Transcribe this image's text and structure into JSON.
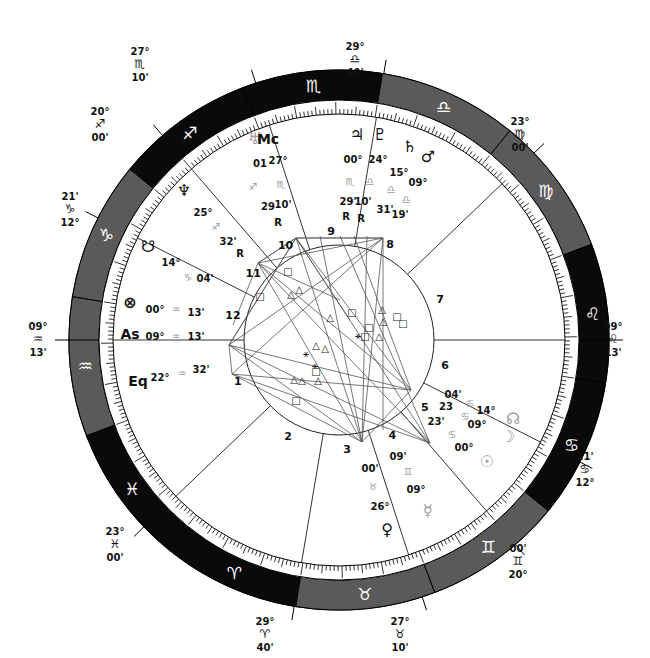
{
  "center": {
    "x": 339,
    "y": 340
  },
  "radii": {
    "outer": 270,
    "sign_inner": 240,
    "tick_inner": 226,
    "inner_circle": 95
  },
  "colors": {
    "dark": "#0a0a0a",
    "gray": "#5a5a5a",
    "line": "#333333",
    "text": "#111111",
    "faint": "#9a9a9a"
  },
  "ascendant_longitude": 309.217,
  "signs": [
    {
      "name": "Aries",
      "glyph": "♈",
      "start": 0,
      "shade": "dark"
    },
    {
      "name": "Taurus",
      "glyph": "♉",
      "start": 30,
      "shade": "gray"
    },
    {
      "name": "Gemini",
      "glyph": "♊",
      "start": 60,
      "shade": "gray"
    },
    {
      "name": "Cancer",
      "glyph": "♋",
      "start": 90,
      "shade": "dark"
    },
    {
      "name": "Leo",
      "glyph": "♌",
      "start": 120,
      "shade": "dark"
    },
    {
      "name": "Virgo",
      "glyph": "♍",
      "start": 150,
      "shade": "gray"
    },
    {
      "name": "Libra",
      "glyph": "♎",
      "start": 180,
      "shade": "gray"
    },
    {
      "name": "Scorpio",
      "glyph": "♏",
      "start": 210,
      "shade": "dark"
    },
    {
      "name": "Sagittarius",
      "glyph": "♐",
      "start": 240,
      "shade": "dark"
    },
    {
      "name": "Capricorn",
      "glyph": "♑",
      "start": 270,
      "shade": "gray"
    },
    {
      "name": "Aquarius",
      "glyph": "♒",
      "start": 300,
      "shade": "gray"
    },
    {
      "name": "Pisces",
      "glyph": "♓",
      "start": 330,
      "shade": "dark"
    }
  ],
  "houses": [
    {
      "num": "1",
      "lon": 309.217,
      "deg": "09°",
      "sign": "♒",
      "min": "13'"
    },
    {
      "num": "2",
      "lon": 353.0,
      "deg": "23°",
      "sign": "♓",
      "min": "00'"
    },
    {
      "num": "3",
      "lon": 29.667,
      "deg": "29°",
      "sign": "♈",
      "min": "40'"
    },
    {
      "num": "4",
      "lon": 57.167,
      "deg": "27°",
      "sign": "♉",
      "min": "10'"
    },
    {
      "num": "5",
      "lon": 80.0,
      "deg": "20°",
      "sign": "♊",
      "min": "00'"
    },
    {
      "num": "6",
      "lon": 102.35,
      "deg": "12°",
      "sign": "♋",
      "min": "21'"
    },
    {
      "num": "7",
      "lon": 129.217,
      "deg": "09°",
      "sign": "♌",
      "min": "13'"
    },
    {
      "num": "8",
      "lon": 173.0,
      "deg": "23°",
      "sign": "♍",
      "min": "00'"
    },
    {
      "num": "9",
      "lon": 209.667,
      "deg": "29°",
      "sign": "♎",
      "min": "40'"
    },
    {
      "num": "10",
      "lon": 237.167,
      "deg": "27°",
      "sign": "♏",
      "min": "10'"
    },
    {
      "num": "11",
      "lon": 260.0,
      "deg": "20°",
      "sign": "♐",
      "min": "00'"
    },
    {
      "num": "12",
      "lon": 282.35,
      "deg": "12°",
      "sign": "♑",
      "min": "21'"
    }
  ],
  "cusp_labels": [
    {
      "id": "cusp-10",
      "text": [
        "27°",
        "♏",
        "10'"
      ],
      "x": 140,
      "y": 55
    },
    {
      "id": "cusp-9",
      "text": [
        "29°",
        "♎",
        "40'"
      ],
      "x": 355,
      "y": 50
    },
    {
      "id": "cusp-11",
      "text": [
        "20°",
        "♐",
        "00'"
      ],
      "x": 100,
      "y": 115
    },
    {
      "id": "cusp-8",
      "text": [
        "23°",
        "♍",
        "00'"
      ],
      "x": 520,
      "y": 125
    },
    {
      "id": "cusp-12",
      "text": [
        "21'",
        "♑",
        "12°"
      ],
      "x": 70,
      "y": 200
    },
    {
      "id": "cusp-1",
      "text": [
        "09°",
        "♒",
        "13'"
      ],
      "x": 38,
      "y": 330
    },
    {
      "id": "cusp-7",
      "text": [
        "09°",
        "♌",
        "13'"
      ],
      "x": 613,
      "y": 330
    },
    {
      "id": "cusp-6",
      "text": [
        "21'",
        "♋",
        "12°"
      ],
      "x": 585,
      "y": 460
    },
    {
      "id": "cusp-2",
      "text": [
        "23°",
        "♓",
        "00'"
      ],
      "x": 115,
      "y": 535
    },
    {
      "id": "cusp-5",
      "text": [
        "00'",
        "♊",
        "20°"
      ],
      "x": 518,
      "y": 552
    },
    {
      "id": "cusp-3",
      "text": [
        "29°",
        "♈",
        "40'"
      ],
      "x": 265,
      "y": 625
    },
    {
      "id": "cusp-4",
      "text": [
        "27°",
        "♉",
        "10'"
      ],
      "x": 400,
      "y": 625
    }
  ],
  "planets": [
    {
      "name": "Uranus",
      "glyph": "♅",
      "x": 255,
      "y": 144,
      "faint": true,
      "deg": "01",
      "deg_pos": [
        260,
        167
      ],
      "sign": "♐",
      "sign_pos": [
        253,
        190
      ],
      "min": "29",
      "min_pos": [
        268,
        210
      ],
      "retro": "R",
      "retro_pos": [
        278,
        226
      ]
    },
    {
      "name": "Midheaven",
      "glyph": "Mc",
      "x": 268,
      "y": 144,
      "bold": true,
      "deg": "27°",
      "deg_pos": [
        278,
        164
      ],
      "sign": "♏",
      "sign_pos": [
        281,
        188
      ],
      "min": "10'",
      "min_pos": [
        283,
        208
      ]
    },
    {
      "name": "Neptune",
      "glyph": "♆",
      "x": 184,
      "y": 196,
      "deg": "25°",
      "deg_pos": [
        203,
        216
      ],
      "sign": "♐",
      "sign_pos": [
        216,
        230
      ],
      "min": "32'",
      "min_pos": [
        228,
        245
      ],
      "retro": "R",
      "retro_pos": [
        240,
        257
      ]
    },
    {
      "name": "Jupiter",
      "glyph": "♃",
      "x": 357,
      "y": 140,
      "deg": "00°",
      "deg_pos": [
        353,
        163
      ],
      "sign": "♏",
      "sign_pos": [
        350,
        185
      ],
      "min": "29'",
      "min_pos": [
        348,
        205
      ],
      "retro": "R",
      "retro_pos": [
        346,
        220
      ]
    },
    {
      "name": "Pluto",
      "glyph": "♇",
      "x": 380,
      "y": 140,
      "deg": "24°",
      "deg_pos": [
        378,
        163
      ],
      "sign": "♎",
      "sign_pos": [
        370,
        185
      ],
      "min": "10'",
      "min_pos": [
        363,
        205
      ],
      "retro": "R",
      "retro_pos": [
        361,
        222
      ]
    },
    {
      "name": "Saturn",
      "glyph": "♄",
      "x": 410,
      "y": 152,
      "deg": "15°",
      "deg_pos": [
        399,
        176
      ],
      "sign": "♎",
      "sign_pos": [
        391,
        193
      ],
      "min": "31'",
      "min_pos": [
        385,
        213
      ]
    },
    {
      "name": "Mars",
      "glyph": "♂",
      "x": 428,
      "y": 162,
      "deg": "09°",
      "deg_pos": [
        418,
        186
      ],
      "sign": "♎",
      "sign_pos": [
        406,
        203
      ],
      "min": "19'",
      "min_pos": [
        400,
        218
      ]
    },
    {
      "name": "South Node",
      "glyph": "☋",
      "x": 148,
      "y": 252,
      "deg": "14°",
      "deg_pos": [
        171,
        266
      ],
      "sign": "♑",
      "sign_pos": [
        188,
        281
      ],
      "min": "04'",
      "min_pos": [
        205,
        282
      ]
    },
    {
      "name": "Part of Fortune",
      "glyph": "⊗",
      "x": 130,
      "y": 308,
      "deg": "00°",
      "deg_pos": [
        155,
        313
      ],
      "sign": "♒",
      "sign_pos": [
        176,
        313
      ],
      "min": "13'",
      "min_pos": [
        196,
        316
      ]
    },
    {
      "name": "Ascendant",
      "glyph": "As",
      "x": 130,
      "y": 339,
      "bold": true,
      "deg": "09°",
      "deg_pos": [
        155,
        340
      ],
      "sign": "♒",
      "sign_pos": [
        176,
        340
      ],
      "min": "13'",
      "min_pos": [
        196,
        340
      ]
    },
    {
      "name": "Equatorial Ascendant",
      "glyph": "Eq",
      "x": 138,
      "y": 386,
      "bold": true,
      "deg": "22°",
      "deg_pos": [
        160,
        381
      ],
      "sign": "♒",
      "sign_pos": [
        182,
        377
      ],
      "min": "32'",
      "min_pos": [
        201,
        373
      ]
    },
    {
      "name": "North Node",
      "glyph": "☊",
      "x": 513,
      "y": 424,
      "faint": true,
      "deg": "14°",
      "deg_pos": [
        486,
        414
      ],
      "sign": "♋",
      "sign_pos": [
        470,
        407
      ],
      "min": "04'",
      "min_pos": [
        453,
        398
      ]
    },
    {
      "name": "Moon",
      "glyph": "☽",
      "x": 508,
      "y": 442,
      "faint": true,
      "deg": "09°",
      "deg_pos": [
        477,
        428
      ],
      "sign": "♋",
      "sign_pos": [
        465,
        420
      ],
      "min": "23",
      "min_pos": [
        446,
        410
      ]
    },
    {
      "name": "Sun",
      "glyph": "☉",
      "x": 487,
      "y": 467,
      "faint": true,
      "deg": "00°",
      "deg_pos": [
        464,
        451
      ],
      "sign": "♋",
      "sign_pos": [
        452,
        438
      ],
      "min": "23'",
      "min_pos": [
        436,
        425
      ]
    },
    {
      "name": "Mercury",
      "glyph": "☿",
      "x": 428,
      "y": 516,
      "faint": true,
      "deg": "09°",
      "deg_pos": [
        416,
        493
      ],
      "sign": "♊",
      "sign_pos": [
        408,
        475
      ],
      "min": "09'",
      "min_pos": [
        398,
        460
      ]
    },
    {
      "name": "Venus",
      "glyph": "♀",
      "x": 387,
      "y": 535,
      "deg": "26°",
      "deg_pos": [
        380,
        510
      ],
      "sign": "♉",
      "sign_pos": [
        373,
        490
      ],
      "min": "00'",
      "min_pos": [
        370,
        472
      ]
    }
  ],
  "aspect_lines": [
    [
      [
        258,
        263
      ],
      [
        383,
        238
      ]
    ],
    [
      [
        258,
        263
      ],
      [
        430,
        443
      ]
    ],
    [
      [
        258,
        263
      ],
      [
        411,
        390
      ]
    ],
    [
      [
        258,
        263
      ],
      [
        362,
        442
      ]
    ],
    [
      [
        296,
        238
      ],
      [
        383,
        238
      ]
    ],
    [
      [
        296,
        238
      ],
      [
        430,
        443
      ]
    ],
    [
      [
        296,
        238
      ],
      [
        411,
        390
      ]
    ],
    [
      [
        296,
        238
      ],
      [
        362,
        442
      ]
    ],
    [
      [
        229,
        345
      ],
      [
        430,
        443
      ]
    ],
    [
      [
        229,
        345
      ],
      [
        411,
        390
      ]
    ],
    [
      [
        229,
        345
      ],
      [
        383,
        238
      ]
    ],
    [
      [
        229,
        345
      ],
      [
        296,
        238
      ]
    ],
    [
      [
        232,
        374
      ],
      [
        430,
        443
      ]
    ],
    [
      [
        232,
        374
      ],
      [
        411,
        390
      ]
    ],
    [
      [
        232,
        374
      ],
      [
        362,
        442
      ]
    ],
    [
      [
        232,
        374
      ],
      [
        383,
        238
      ]
    ],
    [
      [
        383,
        238
      ],
      [
        383,
        430
      ]
    ],
    [
      [
        383,
        238
      ],
      [
        362,
        442
      ]
    ],
    [
      [
        367,
        236
      ],
      [
        362,
        442
      ]
    ],
    [
      [
        354,
        236
      ],
      [
        411,
        390
      ]
    ],
    [
      [
        258,
        263
      ],
      [
        233,
        325
      ]
    ],
    [
      [
        296,
        238
      ],
      [
        258,
        263
      ]
    ],
    [
      [
        296,
        238
      ],
      [
        229,
        345
      ]
    ],
    [
      [
        362,
        442
      ],
      [
        411,
        390
      ]
    ],
    [
      [
        383,
        238
      ],
      [
        296,
        238
      ]
    ],
    [
      [
        229,
        345
      ],
      [
        362,
        442
      ]
    ],
    [
      [
        232,
        374
      ],
      [
        229,
        345
      ]
    ],
    [
      [
        320,
        236
      ],
      [
        362,
        442
      ]
    ],
    [
      [
        340,
        236
      ],
      [
        430,
        443
      ]
    ],
    [
      [
        258,
        263
      ],
      [
        296,
        238
      ]
    ],
    [
      [
        296,
        238
      ],
      [
        350,
        320
      ]
    ],
    [
      [
        258,
        263
      ],
      [
        340,
        300
      ]
    ]
  ],
  "aspect_glyphs": [
    {
      "g": "△",
      "x": 291,
      "y": 298
    },
    {
      "g": "△",
      "x": 299,
      "y": 293
    },
    {
      "g": "△",
      "x": 330,
      "y": 321
    },
    {
      "g": "△",
      "x": 316,
      "y": 349
    },
    {
      "g": "△",
      "x": 325,
      "y": 352
    },
    {
      "g": "△",
      "x": 294,
      "y": 383
    },
    {
      "g": "△",
      "x": 302,
      "y": 384
    },
    {
      "g": "△",
      "x": 318,
      "y": 384
    },
    {
      "g": "△",
      "x": 382,
      "y": 313
    },
    {
      "g": "△",
      "x": 383,
      "y": 325
    },
    {
      "g": "△",
      "x": 379,
      "y": 340
    },
    {
      "g": "□",
      "x": 288,
      "y": 275
    },
    {
      "g": "□",
      "x": 260,
      "y": 300
    },
    {
      "g": "□",
      "x": 397,
      "y": 320
    },
    {
      "g": "□",
      "x": 403,
      "y": 327
    },
    {
      "g": "□",
      "x": 296,
      "y": 404
    },
    {
      "g": "□",
      "x": 369,
      "y": 331
    },
    {
      "g": "□",
      "x": 365,
      "y": 340
    },
    {
      "g": "□",
      "x": 352,
      "y": 316
    },
    {
      "g": "□",
      "x": 316,
      "y": 375
    },
    {
      "g": "⚹",
      "x": 358,
      "y": 339
    },
    {
      "g": "⚹",
      "x": 306,
      "y": 357
    },
    {
      "g": "⚹",
      "x": 315,
      "y": 369
    }
  ]
}
